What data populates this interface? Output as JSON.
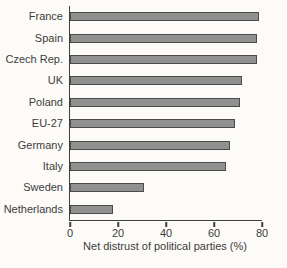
{
  "chart_data": {
    "type": "bar",
    "orientation": "horizontal",
    "categories": [
      "France",
      "Spain",
      "Czech Rep.",
      "UK",
      "Poland",
      "EU-27",
      "Germany",
      "Italy",
      "Sweden",
      "Netherlands"
    ],
    "values": [
      78,
      77,
      77,
      71,
      70,
      68,
      66,
      64,
      30,
      17
    ],
    "title": "",
    "xlabel": "Net distrust of political parties (%)",
    "ylabel": "",
    "xlim": [
      0,
      80
    ],
    "xticks": [
      0,
      20,
      40,
      60,
      80
    ],
    "grid": false,
    "legend": "none",
    "colors": {
      "bar_fill": "#909090",
      "bar_border": "#4b4b4b",
      "axis": "#3f3f3f",
      "text": "#3c3c3c",
      "background": "#fcfbf8"
    }
  }
}
